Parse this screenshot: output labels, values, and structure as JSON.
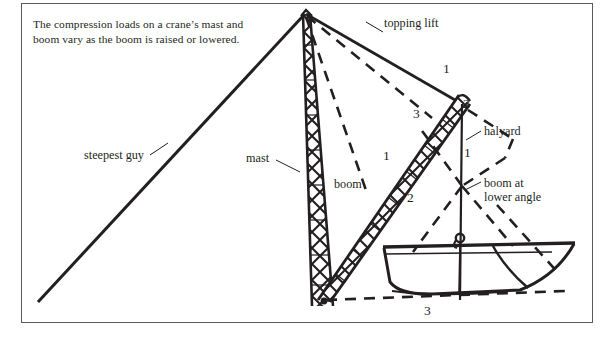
{
  "figure": {
    "caption_lines": [
      "The compression loads on a crane’s mast and",
      "boom vary as the boom is raised or lowered."
    ],
    "labels": {
      "topping_lift": "topping lift",
      "steepest_guy": "steepest guy",
      "mast": "mast",
      "boom": "boom",
      "halyard": "halyard",
      "boom_at_lower_angle_line1": "boom at",
      "boom_at_lower_angle_line2": "lower angle"
    },
    "force_numbers": {
      "topping_lift_upper": "1",
      "boom_tip_upper": "2",
      "topping_lift_lower": "3",
      "boom_upper": "1",
      "boom_lower": "2",
      "halyard_lower": "1",
      "hull_lower": "3"
    },
    "colors": {
      "ink": "#231f20",
      "frame": "#5a5a5a",
      "paper": "#ffffff"
    }
  }
}
